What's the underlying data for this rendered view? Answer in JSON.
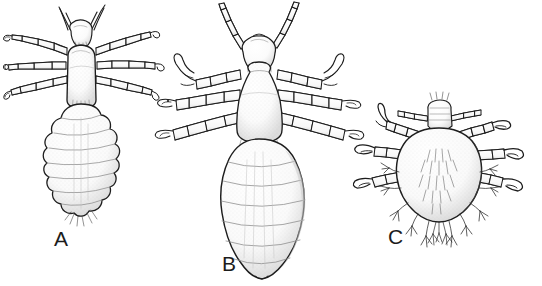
{
  "plate": {
    "title": "Three louse species, dorsal view line drawings",
    "background_color": "#ffffff",
    "ink_color": "#1c1c1c",
    "shade_color": "#8a8a8a",
    "stipple_color": "#b5b5b5",
    "width": 542,
    "height": 286
  },
  "figures": [
    {
      "label": "A",
      "name": "head-louse",
      "description": "Dorsal view of a louse with a rounded dome-shaped thorax and a strongly lobed, scalloped abdomen of about eight segments; three pairs of segmented legs with small hooked claws; short two-segment antennae on a small rounded head.",
      "leg_pairs": 3,
      "abdomen_form": "lobed",
      "antenna_form": "short-forked",
      "label_position": {
        "x": 54,
        "y": 228
      }
    },
    {
      "label": "B",
      "name": "body-louse",
      "description": "Dorsal view of a louse with a pear-shaped thorax and a long smooth oval abdomen tapering to a point; three pairs of robust segmented legs with large hooked claws; long multi-segment antennae angled upward and outward.",
      "leg_pairs": 3,
      "abdomen_form": "smooth-elongate",
      "antenna_form": "long-segmented",
      "label_position": {
        "x": 222,
        "y": 253
      }
    },
    {
      "label": "C",
      "name": "crab-louse",
      "description": "Dorsal view of a broad crab-shaped louse with a short wide body bearing lateral tubercles tipped with hair tufts; small rectangular head with short antennae; three pairs of stout legs ending in heavy pincer-like claws.",
      "leg_pairs": 3,
      "abdomen_form": "broad-hairy",
      "antenna_form": "short-straight",
      "label_position": {
        "x": 388,
        "y": 226
      }
    }
  ],
  "labels": {
    "a": "A",
    "b": "B",
    "c": "C"
  }
}
